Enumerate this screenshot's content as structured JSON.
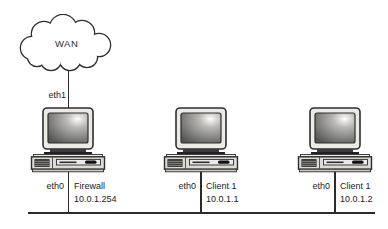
{
  "diagram": {
    "cloud": {
      "label": "WAN"
    },
    "wan_link": {
      "interface": "eth1"
    },
    "nodes": [
      {
        "name": "Firewall",
        "interface": "eth0",
        "ip": "10.0.1.254"
      },
      {
        "name": "Client 1",
        "interface": "eth0",
        "ip": "10.0.1.1"
      },
      {
        "name": "Client 1",
        "interface": "eth0",
        "ip": "10.0.1.2"
      }
    ],
    "colors": {
      "line": "#2b2b2b",
      "text": "#1c1c1c",
      "cloud_fill": "#ffffff",
      "computer_body": "#dddbd4",
      "background": "#ffffff"
    }
  }
}
